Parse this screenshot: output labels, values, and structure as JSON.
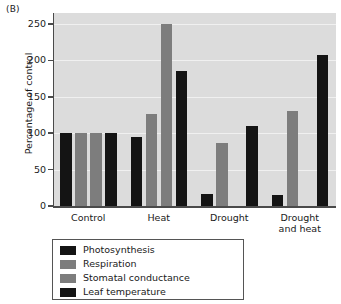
{
  "panel_label": "(B)",
  "chart_data": {
    "type": "bar",
    "title": "",
    "xlabel": "",
    "ylabel": "Percentage of control",
    "ylim": [
      0,
      265
    ],
    "yticks": [
      0,
      50,
      100,
      150,
      200,
      250
    ],
    "ytick_labels": [
      "0",
      "50",
      "100",
      "150",
      "200",
      "250"
    ],
    "grid": true,
    "legend_position": "below-left",
    "categories": [
      "Control",
      "Heat",
      "Drought",
      "Drought\nand heat"
    ],
    "series": [
      {
        "name": "Photosynthesis",
        "color": "#141414",
        "values": [
          100,
          95,
          17,
          15
        ]
      },
      {
        "name": "Respiration",
        "color": "#7d7d7d",
        "values": [
          100,
          127,
          86,
          130
        ]
      },
      {
        "name": "Stomatal conductance",
        "color": "#7d7d7d",
        "values": [
          100,
          250,
          null,
          null
        ]
      },
      {
        "name": "Leaf temperature",
        "color": "#141414",
        "values": [
          100,
          185,
          110,
          207
        ]
      }
    ]
  },
  "colors": {
    "plot_background": "#dcdcdc",
    "gridline": "#f0f0f0",
    "axis": "#4a4a4a",
    "dark_bar": "#141414",
    "gray_bar": "#7d7d7d",
    "page_background": "#ffffff"
  }
}
